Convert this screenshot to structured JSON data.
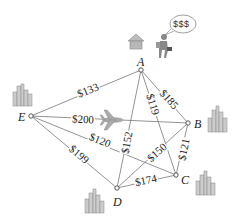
{
  "diagram": {
    "type": "weighted-complete-graph",
    "topic": "traveling salesperson route costs",
    "nodes": [
      {
        "id": "A",
        "label": "A",
        "x": 141,
        "y": 70
      },
      {
        "id": "B",
        "label": "B",
        "x": 188,
        "y": 123
      },
      {
        "id": "C",
        "label": "C",
        "x": 176,
        "y": 175
      },
      {
        "id": "D",
        "label": "D",
        "x": 117,
        "y": 188
      },
      {
        "id": "E",
        "label": "E",
        "x": 31,
        "y": 116
      }
    ],
    "edges": [
      {
        "from": "A",
        "to": "E",
        "label": "$133"
      },
      {
        "from": "A",
        "to": "B",
        "label": "$185"
      },
      {
        "from": "A",
        "to": "C",
        "label": "$119"
      },
      {
        "from": "A",
        "to": "D",
        "label": "$152"
      },
      {
        "from": "E",
        "to": "B",
        "label": "$200"
      },
      {
        "from": "E",
        "to": "C",
        "label": "$120"
      },
      {
        "from": "E",
        "to": "D",
        "label": "$199"
      },
      {
        "from": "D",
        "to": "B",
        "label": "$150"
      },
      {
        "from": "B",
        "to": "C",
        "label": "$121"
      },
      {
        "from": "D",
        "to": "C",
        "label": "$174"
      }
    ],
    "speech_bubble": "$$$",
    "icons": [
      "house-icon",
      "salesperson-icon",
      "airplane-icon",
      "city-skyline-icon"
    ]
  }
}
